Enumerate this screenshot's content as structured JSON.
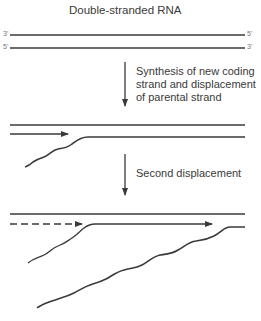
{
  "title": "Double-stranded RNA",
  "initial": {
    "top_strand": {
      "left_end": "3'",
      "right_end": "5'"
    },
    "bottom_strand": {
      "left_end": "5'",
      "right_end": "3'"
    }
  },
  "steps": [
    {
      "label_line1": "Synthesis of new coding",
      "label_line2": "strand and displacement",
      "label_line3": "of parental strand"
    },
    {
      "label_line1": "Second displacement"
    }
  ],
  "colors": {
    "strand": "#3a3a3a",
    "text": "#3a3a3a",
    "background": "#ffffff"
  }
}
